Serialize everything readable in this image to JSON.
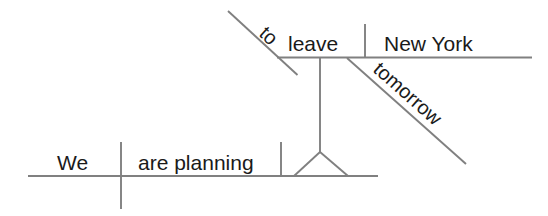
{
  "diagram": {
    "type": "reed-kellogg-sentence-diagram",
    "sentence": "We are planning to leave New York tomorrow.",
    "colors": {
      "line": "#808080",
      "text": "#1a1a1a",
      "background": "#ffffff"
    },
    "main_clause": {
      "subject": "We",
      "predicate": "are planning"
    },
    "infinitive_phrase": {
      "particle": "to",
      "verb": "leave",
      "object": "New York",
      "adverb": "tomorrow"
    }
  }
}
